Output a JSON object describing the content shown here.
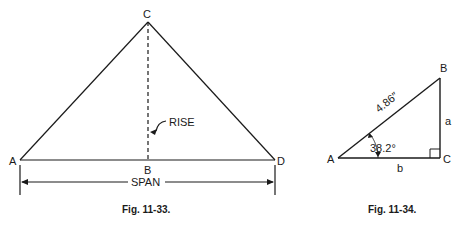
{
  "figures": [
    {
      "caption": "Fig. 11-33.",
      "labels": {
        "apex": "C",
        "left": "A",
        "mid": "B",
        "right": "D",
        "rise": "RISE",
        "span": "SPAN"
      }
    },
    {
      "caption": "Fig. 11-34.",
      "labels": {
        "A": "A",
        "B": "B",
        "C": "C",
        "a": "a",
        "b": "b",
        "hyp": "4.86″",
        "angle": "38.2°"
      }
    }
  ],
  "colors": {
    "ink": "#1a1a1a",
    "background": "#ffffff"
  }
}
